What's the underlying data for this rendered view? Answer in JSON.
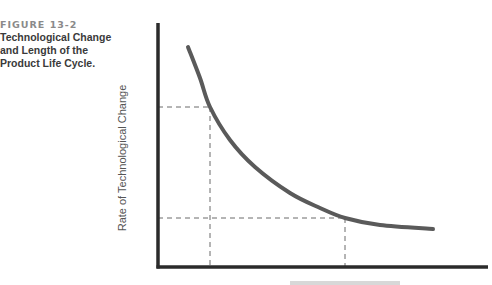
{
  "figure": {
    "number": "FIGURE 13-2",
    "title_lines": [
      "Technological Change",
      "and Length of the",
      "Product Life Cycle."
    ]
  },
  "chart_data": {
    "type": "line",
    "title": "Technological Change and Length of the Product Life Cycle.",
    "ylabel": "Rate of  Technological Change",
    "xlabel": "",
    "grid": false,
    "legend": null,
    "series": [
      {
        "name": "Rate of Technological Change",
        "description": "Downward-sloping convex curve: high rate of technological change at short life cycle, flattening as life cycle lengthens",
        "color": "#5a5a5a",
        "pixel_points": [
          [
            188,
            47
          ],
          [
            200,
            78
          ],
          [
            210,
            107
          ],
          [
            230,
            140
          ],
          [
            255,
            167
          ],
          [
            290,
            193
          ],
          [
            320,
            208
          ],
          [
            345,
            218
          ],
          [
            380,
            225
          ],
          [
            433,
            229
          ]
        ]
      }
    ],
    "reference_lines": [
      {
        "type": "horizontal-dashed",
        "y_px": 107,
        "from_x_px": 158,
        "to_x_px": 210
      },
      {
        "type": "vertical-dashed",
        "x_px": 210,
        "from_y_px": 107,
        "to_y_px": 267
      },
      {
        "type": "horizontal-dashed",
        "y_px": 218,
        "from_x_px": 158,
        "to_x_px": 345
      },
      {
        "type": "vertical-dashed",
        "x_px": 345,
        "from_y_px": 218,
        "to_y_px": 267
      }
    ],
    "axes": {
      "origin_px": [
        158,
        267
      ],
      "y_top_px": 23,
      "x_right_px": 488,
      "ticks": "none"
    }
  },
  "colors": {
    "axis": "#2b2b2b",
    "curve": "#5a5a5a",
    "dashed": "#6a6a6a",
    "figure_number": "#8a8a8a",
    "caption": "#3a3a3a"
  }
}
